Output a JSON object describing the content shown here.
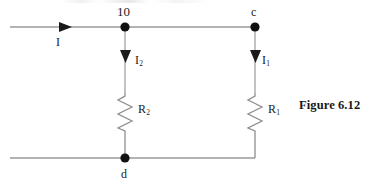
{
  "figure": {
    "caption": "Figure 6.12"
  },
  "nodes": [
    {
      "id": "b",
      "label": "10",
      "x": 125,
      "y": 27
    },
    {
      "id": "c",
      "label": "c",
      "x": 255,
      "y": 27
    },
    {
      "id": "d",
      "label": "d",
      "x": 125,
      "y": 158
    }
  ],
  "currents": [
    {
      "id": "i",
      "label": "I",
      "sub": "",
      "direction": "right"
    },
    {
      "id": "i2",
      "label": "I",
      "sub": "2",
      "direction": "down"
    },
    {
      "id": "i1",
      "label": "I",
      "sub": "1",
      "direction": "down"
    }
  ],
  "resistors": [
    {
      "id": "r2",
      "label": "R",
      "sub": "2",
      "branch": "left"
    },
    {
      "id": "r1",
      "label": "R",
      "sub": "1",
      "branch": "right"
    }
  ],
  "colors": {
    "wire": "#9a9a9a",
    "node_dot": "#111111",
    "arrow": "#1a1a1a",
    "resistor": "#8e8e8e",
    "text": "#1a1a1a",
    "background": "#ffffff"
  },
  "geometry": {
    "top_rail": {
      "x1": 10,
      "x2": 255,
      "y": 27
    },
    "bottom_rail": {
      "x1": 10,
      "x2": 255,
      "y": 158
    },
    "left_branch_x": 125,
    "right_branch_x": 255,
    "resistor_left": {
      "x": 125,
      "y1": 93,
      "y2": 131
    },
    "resistor_right": {
      "x": 255,
      "y1": 93,
      "y2": 131
    }
  }
}
